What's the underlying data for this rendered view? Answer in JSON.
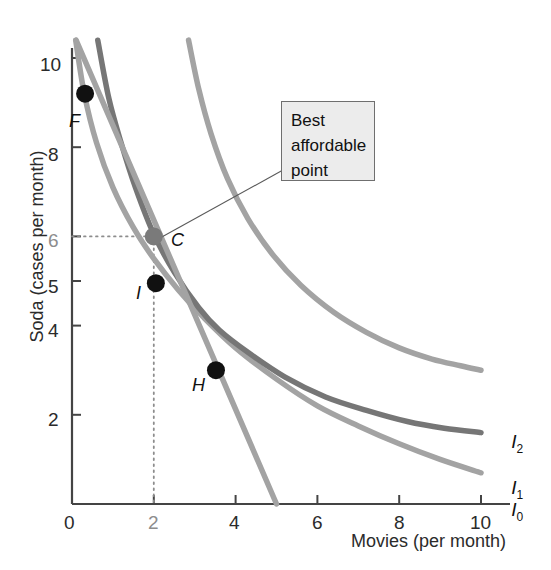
{
  "chart_data": {
    "type": "line",
    "title": "",
    "xlabel": "Movies (per month)",
    "ylabel": "Soda (cases per month)",
    "xlim": [
      0,
      10.6
    ],
    "ylim": [
      0,
      10.6
    ],
    "grid": false,
    "legend_position": "right-of-curve-ends",
    "x_ticks": [
      "0",
      "2",
      "4",
      "6",
      "8",
      "10"
    ],
    "x_tick_values": [
      0,
      2,
      4,
      6,
      8,
      10
    ],
    "y_ticks": [
      "0",
      "2",
      "4",
      "5",
      "6",
      "8",
      "10"
    ],
    "y_tick_values": [
      0,
      2,
      4,
      5,
      6,
      8,
      10
    ],
    "highlighted_y_tick": "6",
    "series": [
      {
        "name": "I0",
        "label": "I",
        "subscript": "0",
        "color": "#a3a3a3",
        "kind": "indifference-curve",
        "points": [
          [
            0.09,
            10.4
          ],
          [
            0.3,
            9.2
          ],
          [
            0.6,
            8.1
          ],
          [
            1.0,
            7.1
          ],
          [
            1.5,
            6.2
          ],
          [
            2.0,
            5.5
          ],
          [
            2.6,
            4.8
          ],
          [
            3.2,
            4.2
          ],
          [
            4.0,
            3.5
          ],
          [
            5.0,
            2.8
          ],
          [
            6.0,
            2.2
          ],
          [
            7.0,
            1.75
          ],
          [
            8.0,
            1.35
          ],
          [
            9.0,
            1.0
          ],
          [
            10.0,
            0.7
          ]
        ]
      },
      {
        "name": "I1",
        "label": "I",
        "subscript": "1",
        "color": "#767676",
        "kind": "indifference-curve",
        "points": [
          [
            0.63,
            10.4
          ],
          [
            0.9,
            9.1
          ],
          [
            1.2,
            8.1
          ],
          [
            1.55,
            7.1
          ],
          [
            2.0,
            6.05
          ],
          [
            2.5,
            5.2
          ],
          [
            3.1,
            4.4
          ],
          [
            3.6,
            3.9
          ],
          [
            4.3,
            3.4
          ],
          [
            5.2,
            2.85
          ],
          [
            6.2,
            2.4
          ],
          [
            7.2,
            2.1
          ],
          [
            8.2,
            1.85
          ],
          [
            9.1,
            1.7
          ],
          [
            10.0,
            1.6
          ]
        ]
      },
      {
        "name": "I2",
        "label": "I",
        "subscript": "2",
        "color": "#a3a3a3",
        "kind": "indifference-curve",
        "points": [
          [
            2.85,
            10.4
          ],
          [
            3.1,
            9.3
          ],
          [
            3.4,
            8.3
          ],
          [
            3.8,
            7.3
          ],
          [
            4.3,
            6.4
          ],
          [
            4.9,
            5.6
          ],
          [
            5.6,
            4.9
          ],
          [
            6.4,
            4.3
          ],
          [
            7.2,
            3.85
          ],
          [
            8.0,
            3.5
          ],
          [
            8.8,
            3.25
          ],
          [
            9.5,
            3.1
          ],
          [
            10.0,
            3.0
          ]
        ]
      },
      {
        "name": "budget-line",
        "label": "",
        "subscript": "",
        "color": "#a3a3a3",
        "kind": "budget-line",
        "points": [
          [
            0.1,
            10.4
          ],
          [
            5.0,
            0.0
          ]
        ]
      }
    ],
    "points": [
      {
        "id": "F",
        "label": "F",
        "x": 0.32,
        "y": 9.2,
        "fill": "#111111",
        "radius": 9,
        "label_dx": -12,
        "label_dy": 14
      },
      {
        "id": "C",
        "label": "C",
        "x": 2.0,
        "y": 6.0,
        "fill": "#7a7a7a",
        "radius": 9,
        "label_dx": 12,
        "label_dy": 2
      },
      {
        "id": "I",
        "label": "I",
        "x": 2.05,
        "y": 4.95,
        "fill": "#111111",
        "radius": 9,
        "label_dx": -20,
        "label_dy": 6
      },
      {
        "id": "H",
        "label": "H",
        "x": 3.52,
        "y": 3.0,
        "fill": "#111111",
        "radius": 9,
        "label_dx": -22,
        "label_dy": 16
      }
    ],
    "guides": [
      {
        "name": "c-horizontal-dotted",
        "from": [
          0,
          6
        ],
        "to": [
          2,
          6
        ],
        "style": "dotted"
      },
      {
        "name": "c-vertical-dotted",
        "from": [
          2,
          6
        ],
        "to": [
          2,
          0
        ],
        "style": "dotted"
      }
    ],
    "annotations": [
      {
        "name": "best-affordable-point-callout",
        "lines": [
          "Best",
          "affordable",
          "point"
        ],
        "text": "Best affordable point",
        "anchor_point": "C",
        "box_fill": "#ececec",
        "box_border": "#6f6f6f"
      }
    ]
  },
  "axes": {
    "x_title": "Movies (per month)",
    "y_title": "Soda (cases per month)"
  },
  "callout": {
    "line1": "Best",
    "line2": "affordable",
    "line3": "point"
  },
  "curve_labels": {
    "i2": {
      "base": "I",
      "sub": "2"
    },
    "i1": {
      "base": "I",
      "sub": "1"
    },
    "i0": {
      "base": "I",
      "sub": "0"
    }
  },
  "point_labels": {
    "f": "F",
    "c": "C",
    "i": "I",
    "h": "H"
  },
  "tick_labels": {
    "x": [
      "0",
      "2",
      "4",
      "6",
      "8",
      "10"
    ],
    "y": [
      "10",
      "8",
      "6",
      "5",
      "4",
      "2"
    ]
  }
}
